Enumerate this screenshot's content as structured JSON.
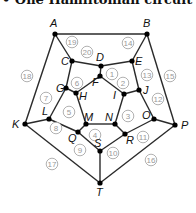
{
  "caption": "• One Hamiltonian circuit is as",
  "nodes": [
    {
      "id": "A",
      "x": 55,
      "y": 34,
      "lx": 50,
      "ly": 27
    },
    {
      "id": "B",
      "x": 147,
      "y": 34,
      "lx": 143,
      "ly": 27
    },
    {
      "id": "C",
      "x": 72,
      "y": 61,
      "lx": 61,
      "ly": 65
    },
    {
      "id": "D",
      "x": 101,
      "y": 66,
      "lx": 96,
      "ly": 61
    },
    {
      "id": "E",
      "x": 132,
      "y": 61,
      "lx": 135,
      "ly": 65
    },
    {
      "id": "F",
      "x": 100,
      "y": 76,
      "lx": 92,
      "ly": 86
    },
    {
      "id": "G",
      "x": 66,
      "y": 88,
      "lx": 56,
      "ly": 92
    },
    {
      "id": "H",
      "x": 76,
      "y": 93,
      "lx": 79,
      "ly": 100
    },
    {
      "id": "I",
      "x": 124,
      "y": 94,
      "lx": 113,
      "ly": 99
    },
    {
      "id": "J",
      "x": 139,
      "y": 90,
      "lx": 143,
      "ly": 94
    },
    {
      "id": "K",
      "x": 25,
      "y": 124,
      "lx": 12,
      "ly": 128
    },
    {
      "id": "L",
      "x": 49,
      "y": 119,
      "lx": 42,
      "ly": 115
    },
    {
      "id": "M",
      "x": 86,
      "y": 124,
      "lx": 84,
      "ly": 121
    },
    {
      "id": "N",
      "x": 115,
      "y": 124,
      "lx": 105,
      "ly": 121
    },
    {
      "id": "O",
      "x": 154,
      "y": 119,
      "lx": 142,
      "ly": 119
    },
    {
      "id": "P",
      "x": 175,
      "y": 125,
      "lx": 181,
      "ly": 129
    },
    {
      "id": "Q",
      "x": 78,
      "y": 132,
      "lx": 68,
      "ly": 142
    },
    {
      "id": "R",
      "x": 125,
      "y": 134,
      "lx": 126,
      "ly": 144
    },
    {
      "id": "S",
      "x": 100,
      "y": 151,
      "lx": 94,
      "ly": 147
    },
    {
      "id": "T",
      "x": 100,
      "y": 183,
      "lx": 96,
      "ly": 196
    }
  ],
  "edges": [
    [
      "A",
      "B"
    ],
    [
      "B",
      "P"
    ],
    [
      "P",
      "T"
    ],
    [
      "T",
      "K"
    ],
    [
      "K",
      "A"
    ],
    [
      "A",
      "C"
    ],
    [
      "B",
      "E"
    ],
    [
      "K",
      "L"
    ],
    [
      "P",
      "O"
    ],
    [
      "T",
      "S"
    ],
    [
      "C",
      "D"
    ],
    [
      "D",
      "E"
    ],
    [
      "E",
      "J"
    ],
    [
      "J",
      "O"
    ],
    [
      "O",
      "R"
    ],
    [
      "R",
      "S"
    ],
    [
      "S",
      "Q"
    ],
    [
      "Q",
      "L"
    ],
    [
      "L",
      "G"
    ],
    [
      "G",
      "C"
    ],
    [
      "D",
      "F"
    ],
    [
      "J",
      "I"
    ],
    [
      "R",
      "N"
    ],
    [
      "Q",
      "M"
    ],
    [
      "G",
      "H"
    ],
    [
      "F",
      "H"
    ],
    [
      "F",
      "I"
    ],
    [
      "I",
      "N"
    ],
    [
      "N",
      "M"
    ],
    [
      "M",
      "H"
    ]
  ],
  "weights": [
    {
      "label": "19",
      "x": 72,
      "y": 42
    },
    {
      "label": "20",
      "x": 87,
      "y": 52
    },
    {
      "label": "14",
      "x": 128,
      "y": 43
    },
    {
      "label": "18",
      "x": 27,
      "y": 76
    },
    {
      "label": "15",
      "x": 170,
      "y": 76
    },
    {
      "label": "13",
      "x": 147,
      "y": 75
    },
    {
      "label": "6",
      "x": 77,
      "y": 83
    },
    {
      "label": "1",
      "x": 112,
      "y": 74
    },
    {
      "label": "2",
      "x": 123,
      "y": 83
    },
    {
      "label": "7",
      "x": 46,
      "y": 98
    },
    {
      "label": "5",
      "x": 69,
      "y": 112
    },
    {
      "label": "12",
      "x": 158,
      "y": 99
    },
    {
      "label": "3",
      "x": 128,
      "y": 116
    },
    {
      "label": "8",
      "x": 56,
      "y": 128
    },
    {
      "label": "4",
      "x": 95,
      "y": 135
    },
    {
      "label": "9",
      "x": 80,
      "y": 150
    },
    {
      "label": "10",
      "x": 113,
      "y": 153
    },
    {
      "label": "11",
      "x": 143,
      "y": 137
    },
    {
      "label": "16",
      "x": 151,
      "y": 160
    },
    {
      "label": "17",
      "x": 52,
      "y": 164
    }
  ],
  "colors": {
    "edge": "#2a2a2a",
    "node": "#000000",
    "weight": "#9a9a9a"
  }
}
